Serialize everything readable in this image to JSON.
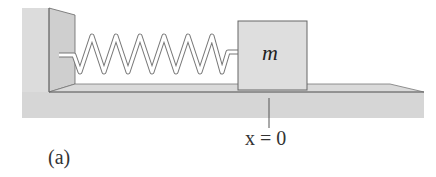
{
  "figure": {
    "panel_label": "(a)",
    "mass_label": "m",
    "position_label": "x = 0",
    "components": [
      "wall",
      "spring",
      "block",
      "floor",
      "equilibrium-marker"
    ],
    "colors": {
      "surface": "#d9d9d9",
      "surface_dark": "#cbcbcb",
      "outline": "#555555",
      "spring": "#ffffff"
    }
  }
}
